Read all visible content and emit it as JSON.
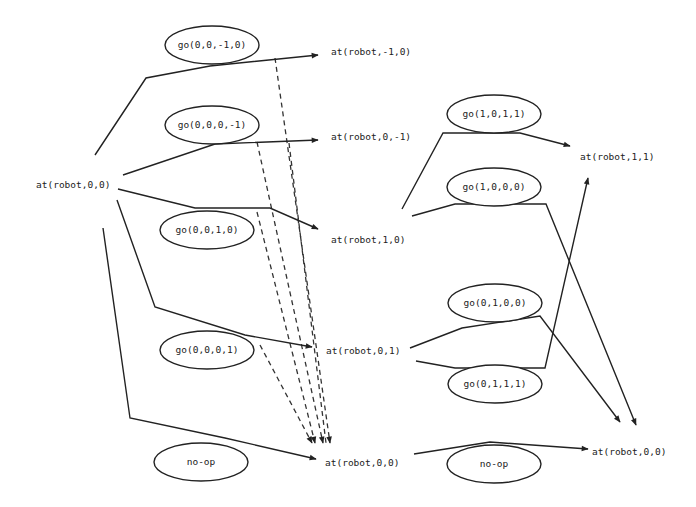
{
  "diagram": {
    "type": "planning-graph",
    "level0": {
      "propositions": [
        {
          "id": "p0_00",
          "label": "at(robot,0,0)"
        }
      ]
    },
    "level1": {
      "actions": [
        {
          "id": "a1_1",
          "label": "go(0,0,-1,0)"
        },
        {
          "id": "a1_2",
          "label": "go(0,0,0,-1)"
        },
        {
          "id": "a1_3",
          "label": "go(0,0,1,0)"
        },
        {
          "id": "a1_4",
          "label": "go(0,0,0,1)"
        },
        {
          "id": "a1_5",
          "label": "no-op"
        }
      ],
      "propositions": [
        {
          "id": "p1_m10",
          "label": "at(robot,-1,0)"
        },
        {
          "id": "p1_0m1",
          "label": "at(robot,0,-1)"
        },
        {
          "id": "p1_10",
          "label": "at(robot,1,0)"
        },
        {
          "id": "p1_01",
          "label": "at(robot,0,1)"
        },
        {
          "id": "p1_00",
          "label": "at(robot,0,0)"
        }
      ]
    },
    "level2": {
      "actions": [
        {
          "id": "a2_1",
          "label": "go(1,0,1,1)"
        },
        {
          "id": "a2_2",
          "label": "go(1,0,0,0)"
        },
        {
          "id": "a2_3",
          "label": "go(0,1,0,0)"
        },
        {
          "id": "a2_4",
          "label": "go(0,1,1,1)"
        },
        {
          "id": "a2_5",
          "label": "no-op"
        }
      ],
      "propositions": [
        {
          "id": "p2_11",
          "label": "at(robot,1,1)"
        },
        {
          "id": "p2_00",
          "label": "at(robot,0,0)"
        }
      ]
    },
    "edges": {
      "solid": [
        [
          "p0_00",
          "a1_1",
          "p1_m10"
        ],
        [
          "p0_00",
          "a1_2",
          "p1_0m1"
        ],
        [
          "p0_00",
          "a1_3",
          "p1_10"
        ],
        [
          "p0_00",
          "a1_4",
          "p1_01"
        ],
        [
          "p0_00",
          "a1_5",
          "p1_00"
        ],
        [
          "p1_10",
          "a2_1",
          "p2_11"
        ],
        [
          "p1_10",
          "a2_2",
          "p2_00"
        ],
        [
          "p1_01",
          "a2_3",
          "p2_00"
        ],
        [
          "p1_01",
          "a2_4",
          "p2_11"
        ],
        [
          "p1_00",
          "a2_5",
          "p2_00"
        ]
      ],
      "dashed_delete_effects": [
        [
          "a1_1",
          "p1_00"
        ],
        [
          "a1_2",
          "p1_00"
        ],
        [
          "a1_3",
          "p1_00"
        ],
        [
          "a1_4",
          "p1_00"
        ]
      ]
    },
    "colors": {
      "stroke": "#222222",
      "background": "#ffffff"
    }
  }
}
